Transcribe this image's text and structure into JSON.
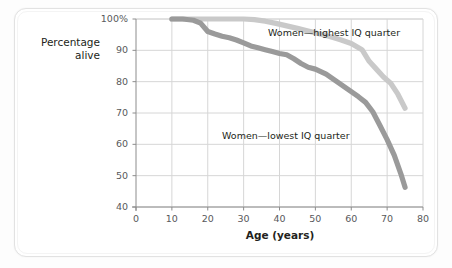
{
  "figure": {
    "y_axis_title": "Percentage\nalive",
    "x_axis_title": "Age (years)"
  },
  "annotations": {
    "highest": "Women—highest IQ quarter",
    "lowest": "Women—lowest IQ quarter"
  },
  "axes": {
    "y_ticks": [
      "100%",
      "90",
      "80",
      "70",
      "60",
      "50",
      "40"
    ],
    "x_ticks": [
      "0",
      "10",
      "20",
      "30",
      "40",
      "50",
      "60",
      "70",
      "80"
    ]
  },
  "colors": {
    "highest_line": "#c9c9c9",
    "lowest_line": "#9a9a9a",
    "grid": "#d6d6d6",
    "axis": "#8c8c8c",
    "text": "#231f20",
    "tick_text": "#58595b",
    "card_border": "#e2e2e2"
  },
  "chart_data": {
    "type": "line",
    "title": "",
    "xlabel": "Age (years)",
    "ylabel": "Percentage alive",
    "xlim": [
      0,
      80
    ],
    "ylim": [
      40,
      100
    ],
    "grid": true,
    "legend_position": "inline-annotations",
    "x_ticks": [
      0,
      10,
      20,
      30,
      40,
      50,
      60,
      70,
      80
    ],
    "y_ticks": [
      40,
      50,
      60,
      70,
      80,
      90,
      100
    ],
    "series": [
      {
        "name": "Women—highest IQ quarter",
        "color": "#c9c9c9",
        "x": [
          10,
          15,
          20,
          25,
          30,
          33,
          36,
          39,
          42,
          45,
          48,
          51,
          54,
          57,
          60,
          63,
          65,
          67,
          69,
          71,
          73,
          75
        ],
        "values": [
          100,
          100,
          100,
          100,
          100,
          99.8,
          99.3,
          98.6,
          97.8,
          97.0,
          96.2,
          95.3,
          94.4,
          93.4,
          92.2,
          90.2,
          86.5,
          84.0,
          81.5,
          79.5,
          76.0,
          71.5
        ]
      },
      {
        "name": "Women—lowest IQ quarter",
        "color": "#9a9a9a",
        "x": [
          10,
          13,
          16,
          18,
          20,
          22,
          24,
          26,
          28,
          30,
          32,
          34,
          36,
          38,
          40,
          42,
          44,
          46,
          48,
          50,
          53,
          56,
          59,
          62,
          64,
          66,
          68,
          70,
          72,
          74,
          75
        ],
        "values": [
          100,
          100,
          99.6,
          98.7,
          96.0,
          95.2,
          94.5,
          94.0,
          93.3,
          92.4,
          91.4,
          90.8,
          90.2,
          89.6,
          89.0,
          88.6,
          87.3,
          85.8,
          84.6,
          84.0,
          82.4,
          80.0,
          77.6,
          75.2,
          73.4,
          70.4,
          66.0,
          61.5,
          56.5,
          50.0,
          46.3
        ]
      }
    ]
  }
}
